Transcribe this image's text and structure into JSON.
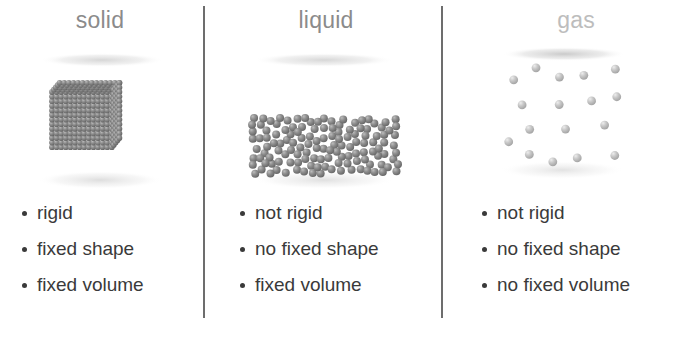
{
  "diagram": {
    "background_color": "#ffffff",
    "divider_color": "#6d6d6d",
    "text_color": "#3a3a3a",
    "bullet_marker": "•"
  },
  "columns": [
    {
      "id": "solid",
      "heading": "solid",
      "heading_color": "#8b8b8b",
      "particle_color": "#7d7d7d",
      "arrangement": "ordered close-packed cubic lattice",
      "bullets": [
        "rigid",
        "fixed shape",
        "fixed volume"
      ]
    },
    {
      "id": "liquid",
      "heading": "liquid",
      "heading_color": "#8b8b8b",
      "particle_color": "#7d7d7d",
      "arrangement": "randomly packed, fills lower half of vessel",
      "bullets": [
        "not rigid",
        "no fixed shape",
        "fixed volume"
      ]
    },
    {
      "id": "gas",
      "heading": "gas",
      "heading_color": "#bdbdbd",
      "particle_color": "#c3c3c3",
      "arrangement": "sparse, widely separated, fills whole vessel",
      "bullets": [
        "not rigid",
        "no fixed shape",
        "no fixed volume"
      ]
    }
  ]
}
